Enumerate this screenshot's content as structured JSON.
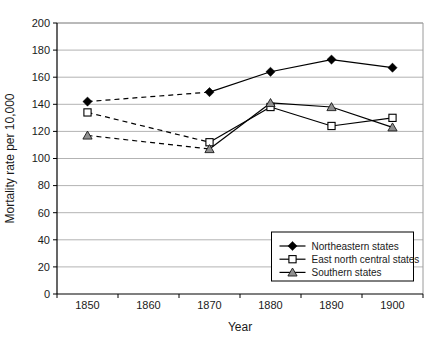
{
  "chart_data": {
    "type": "line",
    "title": "",
    "xlabel": "Year",
    "ylabel": "Mortality rate per 10,000",
    "x_categories": [
      "1850",
      "1860",
      "1870",
      "1880",
      "1890",
      "1900"
    ],
    "ylim": [
      0,
      200
    ],
    "ytick_step": 20,
    "grid": true,
    "legend_position": "bottom-right",
    "dashed_between_categories": [
      "1850",
      "1870"
    ],
    "series": [
      {
        "name": "Northeastern states",
        "marker": "filled-diamond",
        "line_color": "#000000",
        "marker_fill": "#000000",
        "values": [
          142,
          null,
          149,
          164,
          173,
          167
        ]
      },
      {
        "name": "East north central states",
        "marker": "open-square",
        "line_color": "#000000",
        "marker_fill": "#ffffff",
        "values": [
          134,
          null,
          112,
          138,
          124,
          130
        ]
      },
      {
        "name": "Southern states",
        "marker": "filled-triangle",
        "line_color": "#000000",
        "marker_fill": "#8f8f8f",
        "values": [
          117,
          null,
          107,
          141,
          138,
          123
        ]
      }
    ],
    "style": {
      "background": "#ffffff",
      "grid_color": "#b3b3b3",
      "plot_border_color": "#9a9a9a",
      "axis_color": "#000000",
      "text_color": "#1a1a1a",
      "dash_pattern": "5,4"
    }
  }
}
